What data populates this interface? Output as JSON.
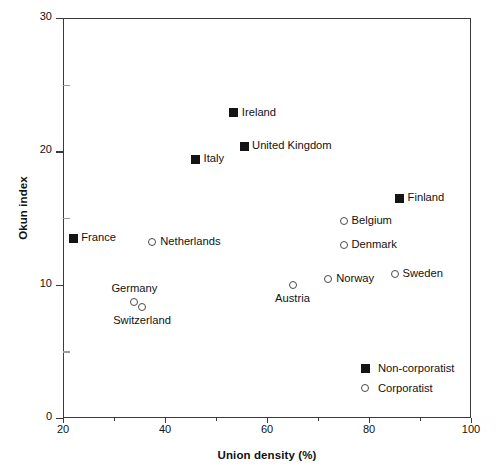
{
  "chart_data": {
    "type": "scatter",
    "title": "",
    "xlabel": "Union density (%)",
    "ylabel": "Okun index",
    "xlim": [
      20,
      100
    ],
    "ylim": [
      0,
      30
    ],
    "x_ticks": [
      20,
      40,
      60,
      80,
      100
    ],
    "x_minor_ticks": [
      30,
      50,
      70,
      90
    ],
    "y_ticks": [
      0,
      10,
      20,
      30
    ],
    "y_minor_ticks": [
      5,
      15,
      25
    ],
    "grid": false,
    "legend_position": "lower right",
    "series": [
      {
        "name": "Non-corporatist",
        "marker": "filled-square",
        "points": [
          {
            "label": "France",
            "x": 22.0,
            "y": 13.5,
            "label_pos": "right"
          },
          {
            "label": "Italy",
            "x": 46.0,
            "y": 19.4,
            "label_pos": "right"
          },
          {
            "label": "Ireland",
            "x": 53.5,
            "y": 22.9,
            "label_pos": "right"
          },
          {
            "label": "United Kingdom",
            "x": 55.5,
            "y": 20.4,
            "label_pos": "right"
          },
          {
            "label": "Finland",
            "x": 86.0,
            "y": 16.5,
            "label_pos": "right"
          }
        ]
      },
      {
        "name": "Corporatist",
        "marker": "open-circle",
        "points": [
          {
            "label": "Netherlands",
            "x": 37.5,
            "y": 13.2,
            "label_pos": "right"
          },
          {
            "label": "Germany",
            "x": 34.0,
            "y": 8.7,
            "label_pos": "above"
          },
          {
            "label": "Switzerland",
            "x": 35.5,
            "y": 8.3,
            "label_pos": "below"
          },
          {
            "label": "Austria",
            "x": 65.0,
            "y": 10.0,
            "label_pos": "below"
          },
          {
            "label": "Norway",
            "x": 72.0,
            "y": 10.4,
            "label_pos": "right"
          },
          {
            "label": "Belgium",
            "x": 75.0,
            "y": 14.8,
            "label_pos": "right"
          },
          {
            "label": "Denmark",
            "x": 75.0,
            "y": 13.0,
            "label_pos": "right"
          },
          {
            "label": "Sweden",
            "x": 85.0,
            "y": 10.8,
            "label_pos": "right"
          }
        ]
      }
    ],
    "legend": [
      {
        "label": "Non-corporatist",
        "marker": "filled-square"
      },
      {
        "label": "Corporatist",
        "marker": "open-circle"
      }
    ],
    "colors": {
      "marker_fill": "#141414",
      "marker_open_stroke": "#4a4a4a",
      "axis": "#3a3a3a",
      "text": "#111111",
      "background": "#ffffff"
    }
  }
}
